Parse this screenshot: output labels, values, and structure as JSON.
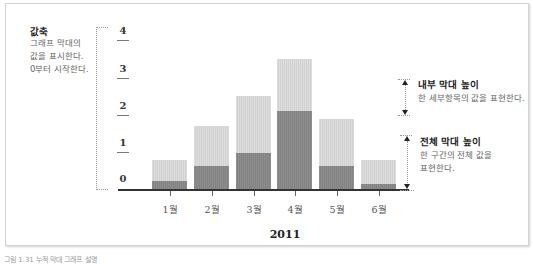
{
  "annotations": {
    "value_axis": {
      "title": "값축",
      "text": "그래프 막대의\n값을 표시한다.\n0부터 시작한다."
    },
    "inner_bar": {
      "title": "내부 막대 높이",
      "text": "한 세부항목의 값을 표현한다."
    },
    "outer_bar": {
      "title": "전체 막대 높이",
      "text": "한 구간의 전체 값을\n표현한다."
    }
  },
  "colors": {
    "outer_bar": "#d8d8d8",
    "inner_bar": "#888888",
    "axis": "#333333"
  },
  "chart_data": {
    "type": "bar",
    "stacked": "overlapped",
    "title": "2011",
    "xlabel": "",
    "ylabel": "",
    "categories": [
      "1월",
      "2월",
      "3월",
      "4월",
      "5월",
      "6월"
    ],
    "series": [
      {
        "name": "전체 막대 (outer)",
        "values": [
          0.8,
          1.7,
          2.5,
          3.5,
          1.9,
          0.8
        ]
      },
      {
        "name": "내부 막대 (inner)",
        "values": [
          0.25,
          0.65,
          1.0,
          2.1,
          0.65,
          0.15
        ]
      }
    ],
    "yticks": [
      "0",
      "1",
      "2",
      "3",
      "4"
    ],
    "ylim": [
      0,
      4
    ],
    "grid": false,
    "legend": "none (annotations on right)"
  },
  "caption": "그림 1.31 누적 막대 그래프 설명"
}
